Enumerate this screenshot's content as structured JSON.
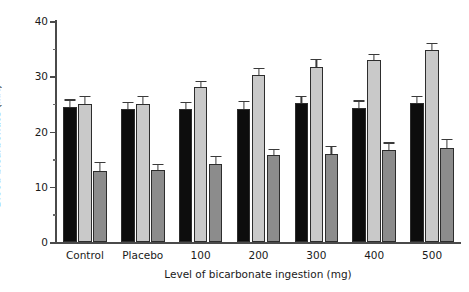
{
  "chart_data": {
    "type": "bar",
    "title": "",
    "xlabel": "Level of bicarbonate ingestion (mg)",
    "ylabel": "Blood bicarbonate (mM)",
    "ylabel_text": "Blood bicarbonate (",
    "ylabel_unit": "mM",
    "ylabel_text_end": ")",
    "categories": [
      "Control",
      "Placebo",
      "100",
      "200",
      "300",
      "400",
      "500"
    ],
    "ylim": [
      0,
      40
    ],
    "ytick_labels": [
      "0",
      "10",
      "20",
      "30",
      "40"
    ],
    "ytick_values": [
      0,
      10,
      20,
      30,
      40
    ],
    "yminor_values": [
      5,
      15,
      25,
      35
    ],
    "grid": false,
    "legend": "none",
    "series": [
      {
        "name": "black-series",
        "color": "#0d0d0d",
        "values": [
          24.4,
          24.0,
          24.0,
          24.1,
          25.1,
          24.3,
          25.2
        ],
        "errors": [
          1.2,
          1.1,
          1.1,
          1.2,
          1.1,
          1.1,
          1.1
        ]
      },
      {
        "name": "light-gray-series",
        "color": "#c9c9c9",
        "values": [
          25.0,
          25.0,
          28.0,
          30.2,
          31.7,
          32.9,
          34.8
        ],
        "errors": [
          1.2,
          1.3,
          1.0,
          1.1,
          1.2,
          0.9,
          1.0
        ]
      },
      {
        "name": "medium-gray-series",
        "color": "#8c8c8c",
        "values": [
          12.8,
          13.0,
          14.1,
          15.7,
          16.0,
          16.7,
          17.0
        ],
        "errors": [
          1.5,
          0.9,
          1.2,
          0.9,
          1.2,
          1.1,
          1.4
        ]
      }
    ]
  },
  "axes": {
    "y_axis_color": "#4a4a4a",
    "x_axis_color": "#4a4a4a",
    "bar_outline_color": "#2d2d2d",
    "error_bar_color": "#3a3a3a"
  }
}
